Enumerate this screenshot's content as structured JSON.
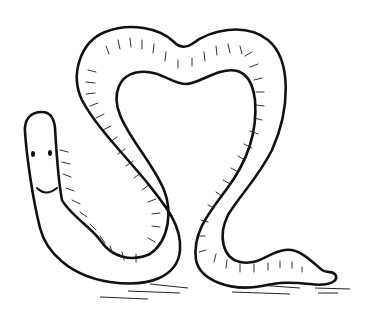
{
  "image": {
    "subject": "Cartoon earthworm line drawing",
    "description": "Smiling worm whose body forms a heart-shaped loop",
    "colors": {
      "line": "#111111",
      "background": "#ffffff"
    }
  }
}
